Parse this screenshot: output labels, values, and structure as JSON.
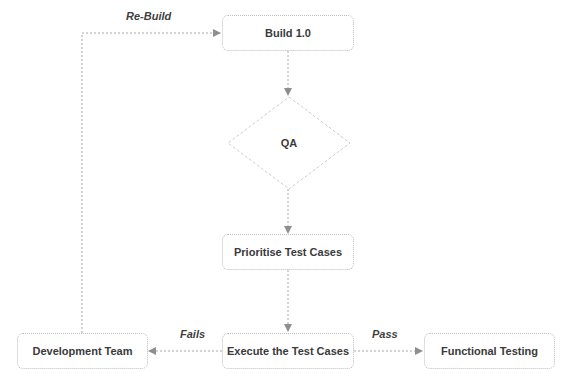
{
  "diagram": {
    "type": "flowchart",
    "colors": {
      "node_border": "#bdbdbd",
      "node_text": "#3a3a3a",
      "edge": "#a8a8a8",
      "arrowhead": "#8f8f8f",
      "background": "#ffffff"
    },
    "nodes": {
      "build": {
        "label": "Build 1.0",
        "shape": "rounded-rect"
      },
      "qa": {
        "label": "QA",
        "shape": "diamond"
      },
      "prioritise": {
        "label": "Prioritise Test Cases",
        "shape": "rounded-rect"
      },
      "execute": {
        "label": "Execute the Test Cases",
        "shape": "rounded-rect"
      },
      "dev_team": {
        "label": "Development Team",
        "shape": "rounded-rect"
      },
      "functional": {
        "label": "Functional Testing",
        "shape": "rounded-rect"
      }
    },
    "edges": {
      "build_to_qa": {
        "from": "Build 1.0",
        "to": "QA",
        "label": ""
      },
      "qa_to_prioritise": {
        "from": "QA",
        "to": "Prioritise Test Cases",
        "label": ""
      },
      "prioritise_to_execute": {
        "from": "Prioritise Test Cases",
        "to": "Execute the Test Cases",
        "label": ""
      },
      "execute_to_dev": {
        "from": "Execute the Test Cases",
        "to": "Development Team",
        "label": "Fails"
      },
      "execute_to_functional": {
        "from": "Execute the Test Cases",
        "to": "Functional Testing",
        "label": "Pass"
      },
      "dev_to_build": {
        "from": "Development Team",
        "to": "Build 1.0",
        "label": "Re-Build"
      }
    }
  }
}
